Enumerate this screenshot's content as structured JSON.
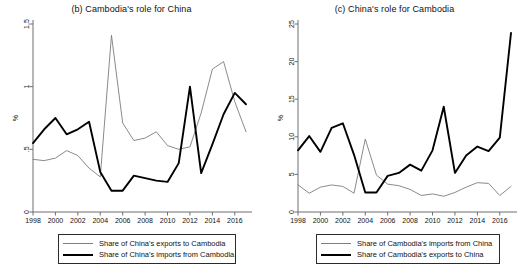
{
  "figure": {
    "background": "#ffffff",
    "line_color_thin": "#7d7d7d",
    "line_color_thick": "#000000"
  },
  "panels": [
    {
      "id": "panel-b",
      "title": "(b) Cambodia's role for China",
      "ylabel": "%",
      "legend": {
        "thin_label": "Share of China's exports to Cambodia",
        "thick_label": "Share of China's imports from Cambodia"
      }
    },
    {
      "id": "panel-c",
      "title": "(c) China's role for Cambodia",
      "ylabel": "%",
      "legend": {
        "thin_label": "Share of Cambodia's imports from China",
        "thick_label": "Share of Cambodia's exports to China"
      }
    }
  ],
  "chart_data": [
    {
      "type": "line",
      "title": "(b) Cambodia's role for China",
      "xlabel": "",
      "ylabel": "%",
      "x": [
        1998,
        1999,
        2000,
        2001,
        2002,
        2003,
        2004,
        2005,
        2006,
        2007,
        2008,
        2009,
        2010,
        2011,
        2012,
        2013,
        2014,
        2015,
        2016,
        2017
      ],
      "xticks": [
        1998,
        2000,
        2002,
        2004,
        2006,
        2008,
        2010,
        2012,
        2014,
        2016
      ],
      "yticks": [
        0,
        0.5,
        1,
        1.5
      ],
      "ytick_labels": [
        "0",
        ".5",
        "1",
        "1.5"
      ],
      "ylim": [
        0,
        1.5
      ],
      "xlim": [
        1998,
        2017
      ],
      "grid": false,
      "legend_position": "below",
      "series": [
        {
          "name": "Share of China's exports to Cambodia",
          "style": "thin",
          "color": "#7d7d7d",
          "values": [
            0.42,
            0.41,
            0.43,
            0.49,
            0.45,
            0.35,
            0.28,
            1.41,
            0.71,
            0.57,
            0.59,
            0.64,
            0.53,
            0.5,
            0.52,
            0.79,
            1.14,
            1.2,
            0.88,
            0.64
          ]
        },
        {
          "name": "Share of China's imports from Cambodia",
          "style": "thick",
          "color": "#000000",
          "values": [
            0.55,
            0.66,
            0.75,
            0.62,
            0.66,
            0.72,
            0.32,
            0.17,
            0.17,
            0.29,
            0.27,
            0.25,
            0.24,
            0.39,
            1.0,
            0.31,
            0.54,
            0.78,
            0.95,
            0.86
          ]
        }
      ]
    },
    {
      "type": "line",
      "title": "(c) China's role for Cambodia",
      "xlabel": "",
      "ylabel": "%",
      "x": [
        1998,
        1999,
        2000,
        2001,
        2002,
        2003,
        2004,
        2005,
        2006,
        2007,
        2008,
        2009,
        2010,
        2011,
        2012,
        2013,
        2014,
        2015,
        2016,
        2017
      ],
      "xticks": [
        1998,
        2000,
        2002,
        2004,
        2006,
        2008,
        2010,
        2012,
        2014,
        2016
      ],
      "yticks": [
        0,
        5,
        10,
        15,
        20,
        25
      ],
      "ytick_labels": [
        "0",
        "5",
        "10",
        "15",
        "20",
        "25"
      ],
      "ylim": [
        0,
        25
      ],
      "xlim": [
        1998,
        2017
      ],
      "grid": false,
      "legend_position": "below",
      "series": [
        {
          "name": "Share of Cambodia's imports from China",
          "style": "thin",
          "color": "#7d7d7d",
          "values": [
            3.6,
            2.5,
            3.3,
            3.6,
            3.4,
            2.5,
            9.7,
            4.9,
            3.7,
            3.5,
            3.0,
            2.2,
            2.4,
            2.1,
            2.6,
            3.3,
            3.9,
            3.8,
            2.2,
            3.4
          ]
        },
        {
          "name": "Share of Cambodia's exports to China",
          "style": "thick",
          "color": "#000000",
          "values": [
            8.2,
            10.1,
            8.0,
            11.2,
            11.8,
            7.6,
            2.6,
            2.6,
            4.8,
            5.2,
            6.3,
            5.5,
            8.2,
            14.0,
            5.2,
            7.5,
            8.7,
            8.1,
            9.9,
            23.8
          ]
        }
      ]
    }
  ]
}
